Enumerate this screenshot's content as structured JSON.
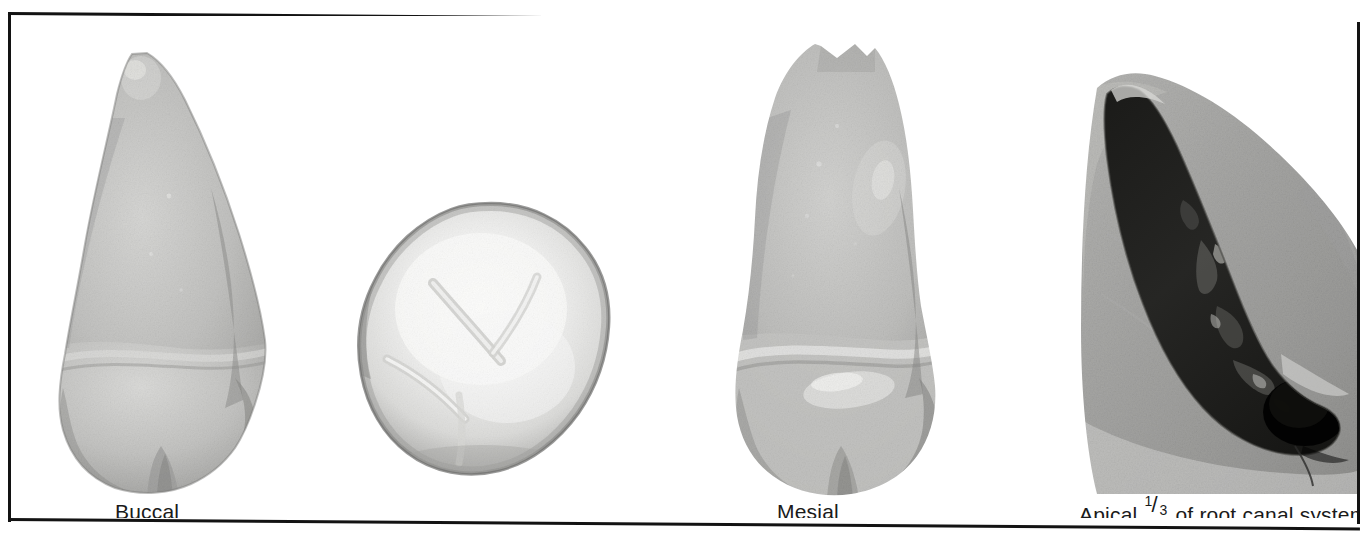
{
  "figure": {
    "type": "photographic-plate",
    "border_color": "#131313",
    "background_color": "#ffffff",
    "panels": [
      {
        "id": "buccal",
        "caption": "Buccal",
        "description": "Buccal (facial) view of an extracted premolar, root uppermost, crown at bottom",
        "has_caption": true
      },
      {
        "id": "occlusal",
        "caption": "",
        "description": "Occlusal view of the crown, rounded oval outline with developmental grooves",
        "has_caption": false
      },
      {
        "id": "mesial",
        "caption": "Mesial",
        "description": "Mesial (proximal) view of the same tooth, broader root with notched apex",
        "has_caption": true
      },
      {
        "id": "apical",
        "caption_prefix": "Apical ",
        "caption_numerator": "1",
        "caption_slash": "/",
        "caption_denominator": "3",
        "caption_suffix": " of root canal system",
        "caption_plain": "Apical 1/3 of root canal system",
        "description": "Cleared/sectioned apical third of the root showing the dark, irregular root canal system within gray dentin",
        "has_caption": true
      }
    ]
  }
}
